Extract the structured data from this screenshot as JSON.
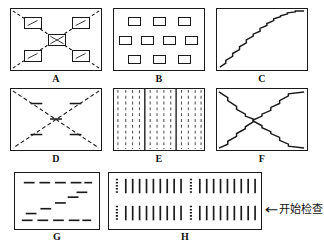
{
  "figure": {
    "kind": "inspection-scan-pattern-diagram",
    "panel_count": 8
  },
  "panels": [
    {
      "id": "A",
      "label": "A",
      "pattern": "four-corner-boxes-with-center-box-and-dashed-diagonals",
      "description": "Rectangle with dashed diagonals from each corner toward a small central box; four small quadrant boxes each containing a short diagonal stroke; central box contains an X",
      "frame": {
        "x": 10,
        "y": 8,
        "w": 92,
        "h": 63
      },
      "label_pos": {
        "x": 10,
        "y": 74,
        "w": 92
      },
      "elements": {
        "corner_boxes": 4,
        "center_boxes": 1,
        "diagonals": 4
      }
    },
    {
      "id": "B",
      "label": "B",
      "pattern": "grid-of-small-rectangles",
      "description": "Three staggered rows of small rectangles: 3 on top, 4 in middle, 3 on bottom",
      "frame": {
        "x": 113,
        "y": 8,
        "w": 92,
        "h": 63
      },
      "label_pos": {
        "x": 113,
        "y": 74,
        "w": 92
      },
      "elements": {
        "rows": [
          3,
          4,
          3
        ],
        "total_boxes": 10
      }
    },
    {
      "id": "C",
      "label": "C",
      "pattern": "single-staircase-diagonal",
      "description": "A staircase (zigzag) dashed path rising from lower-left corner to upper-right corner",
      "frame": {
        "x": 216,
        "y": 8,
        "w": 92,
        "h": 63
      },
      "label_pos": {
        "x": 216,
        "y": 74,
        "w": 92
      },
      "elements": {
        "steps": 11,
        "direction": "bottom-left-to-top-right"
      }
    },
    {
      "id": "D",
      "label": "D",
      "pattern": "dashed-X-with-tick-marks",
      "description": "Rectangle crossed by two dashed diagonals forming an X, with short perpendicular tick marks placed along each diagonal and at the crossing point",
      "frame": {
        "x": 10,
        "y": 88,
        "w": 92,
        "h": 63
      },
      "label_pos": {
        "x": 10,
        "y": 154,
        "w": 92
      },
      "elements": {
        "diagonals": 2,
        "ticks": 5
      }
    },
    {
      "id": "E",
      "label": "E",
      "pattern": "vertical-dashed-lanes-with-solid-dividers",
      "description": "Field of evenly spaced vertical dashed lines divided into three blocks by two solid vertical lines",
      "frame": {
        "x": 113,
        "y": 88,
        "w": 92,
        "h": 63
      },
      "label_pos": {
        "x": 113,
        "y": 154,
        "w": 92
      },
      "elements": {
        "dashed_lines": 12,
        "solid_dividers": 2,
        "blocks": 3
      }
    },
    {
      "id": "F",
      "label": "F",
      "pattern": "staircase-X",
      "description": "Two staircase (zigzag) paths crossing corner to corner to form an X",
      "frame": {
        "x": 216,
        "y": 88,
        "w": 92,
        "h": 63
      },
      "label_pos": {
        "x": 216,
        "y": 154,
        "w": 92
      },
      "elements": {
        "diagonals": 2,
        "steps_per_diagonal": 9
      }
    },
    {
      "id": "G",
      "label": "G",
      "pattern": "two-horizontal-dashed-lines-with-central-staircase",
      "description": "A dashed line near the top, a dashed line near the bottom, and a rising staircase of short dashes between them",
      "frame": {
        "x": 14,
        "y": 172,
        "w": 86,
        "h": 58
      },
      "label_pos": {
        "x": 14,
        "y": 232,
        "w": 86
      },
      "elements": {
        "top_dashes": 5,
        "bottom_dashes": 5,
        "stair_dashes": 5
      }
    },
    {
      "id": "H",
      "label": "H",
      "pattern": "two-rows-of-vertical-strokes-with-dotted-start-markers",
      "description": "Two horizontal bands; each band begins with a dotted vertical marker followed by nine solid vertical strokes, repeated twice across the width",
      "frame": {
        "x": 108,
        "y": 172,
        "w": 154,
        "h": 58
      },
      "label_pos": {
        "x": 108,
        "y": 232,
        "w": 154
      },
      "elements": {
        "rows": 2,
        "groups_per_row": 2,
        "dotted_markers_per_group": 1,
        "solid_strokes_per_group": 9
      }
    }
  ],
  "annotation": {
    "arrow_glyph": "←",
    "text": "开始检查",
    "pos": {
      "x": 266,
      "y": 203
    }
  },
  "colors": {
    "ink": "#1a1a1a",
    "stroke": "#111111",
    "background": "#ffffff"
  }
}
